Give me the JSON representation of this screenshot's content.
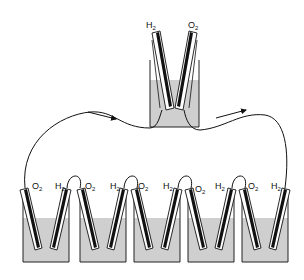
{
  "figure": {
    "colors": {
      "background": "#ffffff",
      "electrolyte": "#cfcfcf",
      "line": "#111111"
    }
  },
  "top_cell": {
    "labels": [
      {
        "text": "H",
        "sub": "2"
      },
      {
        "text": "O",
        "sub": "2"
      }
    ]
  },
  "bottom_cells": [
    {
      "left_label": {
        "text": "O",
        "sub": "2"
      },
      "right_label": {
        "text": "H",
        "sub": "2"
      }
    },
    {
      "left_label": {
        "text": "O",
        "sub": "2"
      },
      "right_label": {
        "text": "H",
        "sub": "2"
      }
    },
    {
      "left_label": {
        "text": "O",
        "sub": "2"
      },
      "right_label": {
        "text": "H",
        "sub": "2"
      }
    },
    {
      "left_label": {
        "text": "O",
        "sub": "2"
      },
      "right_label": {
        "text": "H",
        "sub": "2"
      }
    },
    {
      "left_label": {
        "text": "O",
        "sub": "2"
      },
      "right_label": {
        "text": "H",
        "sub": "2"
      }
    }
  ],
  "arrows": [
    {
      "name": "left-flow-arrow",
      "direction": "right"
    },
    {
      "name": "right-flow-arrow",
      "direction": "right"
    }
  ]
}
